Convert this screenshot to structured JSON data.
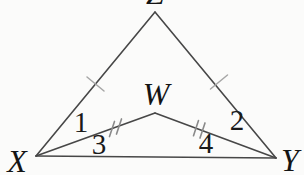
{
  "figure": {
    "type": "geometry-diagram",
    "labels": {
      "z": "Z",
      "w": "W",
      "x": "X",
      "y": "Y",
      "angle1": "1",
      "angle2": "2",
      "angle3": "3",
      "angle4": "4"
    },
    "congruence_marks": {
      "single_tick_sides": [
        "XZ",
        "ZY"
      ],
      "double_tick_sides": [
        "XW",
        "WY"
      ]
    },
    "colors": {
      "line": "#474747",
      "label": "#141414",
      "single_tick": "#a6a6a6",
      "double_tick": "#8a8a8a",
      "background": "#fbfbfa"
    }
  }
}
